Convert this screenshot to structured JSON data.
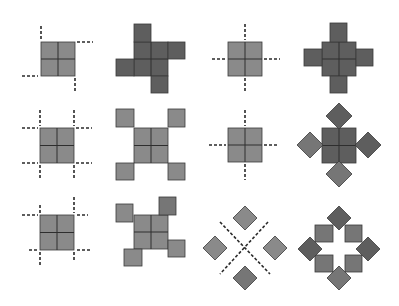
{
  "diagram": {
    "colors": {
      "tile_light": "#8a8a8a",
      "tile_mid": "#767676",
      "tile_dark": "#5e5e5e",
      "outline": "#3a3a3a",
      "dash": "#2a2a2a",
      "background": "#ffffff"
    },
    "panels": [
      {
        "id": "r1c1",
        "label": "base-square-pinwheel-cuts",
        "squares": [
          {
            "x": 41,
            "y": 42,
            "w": 34,
            "h": 34,
            "tone": "light",
            "grid": true
          }
        ],
        "diamonds": [],
        "dashes": [
          [
            41,
            26,
            41,
            40
          ],
          [
            77,
            42,
            93,
            42
          ],
          [
            22,
            76,
            38,
            76
          ],
          [
            75,
            78,
            75,
            92
          ]
        ]
      },
      {
        "id": "r1c2",
        "label": "pinwheel-cross",
        "squares": [
          {
            "x": 134,
            "y": 42,
            "w": 34,
            "h": 34,
            "tone": "dark",
            "grid": true
          },
          {
            "x": 134,
            "y": 24,
            "w": 17,
            "h": 18,
            "tone": "dark",
            "grid": false
          },
          {
            "x": 168,
            "y": 42,
            "w": 17,
            "h": 17,
            "tone": "dark",
            "grid": false
          },
          {
            "x": 116,
            "y": 59,
            "w": 18,
            "h": 17,
            "tone": "dark",
            "grid": false
          },
          {
            "x": 151,
            "y": 76,
            "w": 17,
            "h": 17,
            "tone": "dark",
            "grid": false
          }
        ],
        "diamonds": [],
        "dashes": []
      },
      {
        "id": "r1c3",
        "label": "base-square-midline-cuts",
        "squares": [
          {
            "x": 228,
            "y": 42,
            "w": 34,
            "h": 34,
            "tone": "light",
            "grid": true
          }
        ],
        "diamonds": [],
        "dashes": [
          [
            245,
            24,
            245,
            40
          ],
          [
            245,
            78,
            245,
            93
          ],
          [
            212,
            59,
            226,
            59
          ],
          [
            264,
            59,
            280,
            59
          ]
        ]
      },
      {
        "id": "r1c4",
        "label": "symmetric-cross",
        "squares": [
          {
            "x": 322,
            "y": 42,
            "w": 34,
            "h": 34,
            "tone": "dark",
            "grid": true
          },
          {
            "x": 330,
            "y": 23,
            "w": 17,
            "h": 19,
            "tone": "dark",
            "grid": false
          },
          {
            "x": 330,
            "y": 76,
            "w": 17,
            "h": 17,
            "tone": "dark",
            "grid": false
          },
          {
            "x": 304,
            "y": 49,
            "w": 18,
            "h": 17,
            "tone": "dark",
            "grid": false
          },
          {
            "x": 356,
            "y": 49,
            "w": 17,
            "h": 17,
            "tone": "dark",
            "grid": false
          }
        ],
        "diamonds": [],
        "dashes": []
      },
      {
        "id": "r2c1",
        "label": "base-square-corner-cuts",
        "squares": [
          {
            "x": 40,
            "y": 128,
            "w": 34,
            "h": 35,
            "tone": "light",
            "grid": true
          }
        ],
        "diamonds": [],
        "dashes": [
          [
            40,
            110,
            40,
            126
          ],
          [
            22,
            128,
            38,
            128
          ],
          [
            74,
            110,
            74,
            126
          ],
          [
            76,
            128,
            92,
            128
          ],
          [
            22,
            163,
            38,
            163
          ],
          [
            40,
            165,
            40,
            180
          ],
          [
            76,
            163,
            92,
            163
          ],
          [
            74,
            165,
            74,
            180
          ]
        ]
      },
      {
        "id": "r2c2",
        "label": "corner-squares",
        "squares": [
          {
            "x": 134,
            "y": 128,
            "w": 34,
            "h": 35,
            "tone": "light",
            "grid": true
          },
          {
            "x": 116,
            "y": 109,
            "w": 18,
            "h": 18,
            "tone": "light",
            "grid": false
          },
          {
            "x": 168,
            "y": 109,
            "w": 17,
            "h": 18,
            "tone": "light",
            "grid": false
          },
          {
            "x": 116,
            "y": 163,
            "w": 18,
            "h": 17,
            "tone": "light",
            "grid": false
          },
          {
            "x": 168,
            "y": 163,
            "w": 17,
            "h": 17,
            "tone": "light",
            "grid": false
          }
        ],
        "diamonds": [],
        "dashes": []
      },
      {
        "id": "r2c3",
        "label": "base-square-midline-cuts-2",
        "squares": [
          {
            "x": 228,
            "y": 128,
            "w": 34,
            "h": 34,
            "tone": "light",
            "grid": true
          }
        ],
        "diamonds": [],
        "dashes": [
          [
            245,
            110,
            245,
            126
          ],
          [
            245,
            164,
            245,
            180
          ],
          [
            209,
            145,
            226,
            145
          ],
          [
            264,
            145,
            279,
            145
          ]
        ]
      },
      {
        "id": "r2c4",
        "label": "diamond-cross",
        "squares": [
          {
            "x": 322,
            "y": 128,
            "w": 34,
            "h": 35,
            "tone": "dark",
            "grid": true
          }
        ],
        "diamonds": [
          {
            "cx": 339,
            "cy": 116,
            "r": 13,
            "tone": "dark"
          },
          {
            "cx": 310,
            "cy": 145,
            "r": 13,
            "tone": "mid"
          },
          {
            "cx": 368,
            "cy": 145,
            "r": 13,
            "tone": "dark"
          },
          {
            "cx": 339,
            "cy": 174,
            "r": 13,
            "tone": "mid"
          }
        ],
        "dashes": []
      },
      {
        "id": "r3c1",
        "label": "base-square-offset-corner-cuts",
        "squares": [
          {
            "x": 40,
            "y": 215,
            "w": 34,
            "h": 35,
            "tone": "light",
            "grid": true
          }
        ],
        "diamonds": [],
        "dashes": [
          [
            22,
            215,
            38,
            215
          ],
          [
            40,
            205,
            40,
            213
          ],
          [
            74,
            197,
            74,
            213
          ],
          [
            77,
            215,
            88,
            215
          ],
          [
            29,
            250,
            38,
            250
          ],
          [
            40,
            252,
            40,
            266
          ],
          [
            74,
            252,
            74,
            262
          ],
          [
            77,
            250,
            92,
            250
          ]
        ]
      },
      {
        "id": "r3c2",
        "label": "offset-pinwheel",
        "squares": [
          {
            "x": 134,
            "y": 215,
            "w": 34,
            "h": 34,
            "tone": "light",
            "grid": true
          },
          {
            "x": 116,
            "y": 204,
            "w": 17,
            "h": 18,
            "tone": "light",
            "grid": false
          },
          {
            "x": 159,
            "y": 197,
            "w": 17,
            "h": 18,
            "tone": "mid",
            "grid": false
          },
          {
            "x": 124,
            "y": 249,
            "w": 18,
            "h": 17,
            "tone": "light",
            "grid": false
          },
          {
            "x": 168,
            "y": 240,
            "w": 17,
            "h": 17,
            "tone": "light",
            "grid": false
          }
        ],
        "diamonds": [],
        "dashes": []
      },
      {
        "id": "r3c3",
        "label": "diamonds-diagonal-cuts",
        "squares": [],
        "diamonds": [
          {
            "cx": 245,
            "cy": 218,
            "r": 12,
            "tone": "light"
          },
          {
            "cx": 215,
            "cy": 248,
            "r": 12,
            "tone": "light"
          },
          {
            "cx": 275,
            "cy": 248,
            "r": 12,
            "tone": "light"
          },
          {
            "cx": 245,
            "cy": 278,
            "r": 12,
            "tone": "mid"
          }
        ],
        "dashes": [
          [
            220,
            222,
            270,
            274
          ],
          [
            268,
            222,
            220,
            274
          ]
        ]
      },
      {
        "id": "r3c4",
        "label": "diamond-ring",
        "squares": [
          {
            "x": 315,
            "y": 225,
            "w": 18,
            "h": 17,
            "tone": "mid",
            "grid": false
          },
          {
            "x": 345,
            "y": 225,
            "w": 17,
            "h": 17,
            "tone": "mid",
            "grid": false
          },
          {
            "x": 315,
            "y": 255,
            "w": 18,
            "h": 17,
            "tone": "mid",
            "grid": false
          },
          {
            "x": 345,
            "y": 255,
            "w": 17,
            "h": 17,
            "tone": "mid",
            "grid": false
          }
        ],
        "diamonds": [
          {
            "cx": 339,
            "cy": 218,
            "r": 12,
            "tone": "dark"
          },
          {
            "cx": 310,
            "cy": 249,
            "r": 12,
            "tone": "dark"
          },
          {
            "cx": 368,
            "cy": 249,
            "r": 12,
            "tone": "dark"
          },
          {
            "cx": 339,
            "cy": 278,
            "r": 12,
            "tone": "mid"
          }
        ],
        "dashes": []
      }
    ]
  }
}
